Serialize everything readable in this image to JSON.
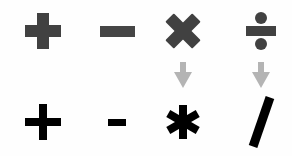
{
  "figure": {
    "kind": "operator-symbol-mapping",
    "background_color": "#fefefe",
    "rows": {
      "math_label": "mathematical notation",
      "code_label": "keyboard / programming notation"
    }
  },
  "colors": {
    "math_symbol": "#414141",
    "code_symbol": "#000000",
    "arrow": "#b4b4b4",
    "background": "#fefefe"
  },
  "columns": [
    {
      "operation": "addition",
      "math": {
        "symbol": "+",
        "icon": "plus-icon",
        "color": "#414141"
      },
      "code": {
        "symbol": "+",
        "icon": "plus-icon",
        "color": "#000000"
      },
      "arrow": {
        "present": false,
        "icon": "arrow-down-icon"
      }
    },
    {
      "operation": "subtraction",
      "math": {
        "symbol": "−",
        "icon": "minus-icon",
        "color": "#454545"
      },
      "code": {
        "symbol": "-",
        "icon": "hyphen-icon",
        "color": "#000000"
      },
      "arrow": {
        "present": false,
        "icon": "arrow-down-icon"
      }
    },
    {
      "operation": "multiplication",
      "math": {
        "symbol": "×",
        "icon": "multiply-icon",
        "color": "#414141"
      },
      "code": {
        "symbol": "*",
        "icon": "asterisk-icon",
        "color": "#000000"
      },
      "arrow": {
        "present": true,
        "icon": "arrow-down-icon",
        "color": "#b4b4b4"
      }
    },
    {
      "operation": "division",
      "math": {
        "symbol": "÷",
        "icon": "obelus-icon",
        "color": "#414141"
      },
      "code": {
        "symbol": "/",
        "icon": "slash-icon",
        "color": "#000000"
      },
      "arrow": {
        "present": true,
        "icon": "arrow-down-icon",
        "color": "#b4b4b4"
      }
    }
  ]
}
